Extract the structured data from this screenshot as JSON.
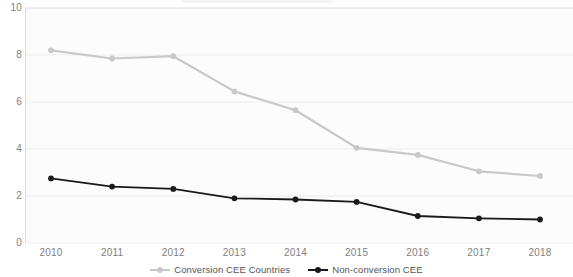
{
  "chart_data": {
    "type": "line",
    "title": "",
    "subtitle": "",
    "xlabel": "",
    "ylabel": "",
    "categories": [
      "2010",
      "2011",
      "2012",
      "2013",
      "2014",
      "2015",
      "2016",
      "2017",
      "2018"
    ],
    "x": [
      2010,
      2011,
      2012,
      2013,
      2014,
      2015,
      2016,
      2017,
      2018
    ],
    "ylim": [
      0,
      10
    ],
    "yticks": [
      "0",
      "2",
      "4",
      "6",
      "8",
      "10"
    ],
    "ytick_values": [
      0,
      2,
      4,
      6,
      8,
      10
    ],
    "grid": true,
    "grid_axis": "y",
    "legend_position": "bottom-center",
    "series": [
      {
        "name": "Conversion CEE Countries",
        "color": "#c9c9c9",
        "marker": "circle",
        "values": [
          8.2,
          7.85,
          7.95,
          6.45,
          5.65,
          4.05,
          3.75,
          3.05,
          2.85
        ]
      },
      {
        "name": "Non-conversion CEE",
        "color": "#1a1a1a",
        "marker": "circle",
        "values": [
          2.75,
          2.4,
          2.3,
          1.9,
          1.85,
          1.75,
          1.15,
          1.05,
          1.0
        ]
      }
    ]
  },
  "axes": {
    "y_tick_labels": [
      "10",
      "8",
      "6",
      "4",
      "2",
      "0"
    ],
    "x_tick_labels": [
      "2010",
      "2011",
      "2012",
      "2013",
      "2014",
      "2015",
      "2016",
      "2017",
      "2018"
    ]
  },
  "legend": {
    "entries": [
      {
        "label": "Conversion CEE Countries",
        "color": "#c9c9c9",
        "marker": "line-dot-icon"
      },
      {
        "label": "Non-conversion CEE",
        "color": "#1a1a1a",
        "marker": "line-dot-icon"
      }
    ]
  },
  "colors": {
    "series_conversion": "#c9c9c9",
    "series_nonconversion": "#1a1a1a",
    "gridline": "#ececec",
    "axis": "#dcdcdc",
    "tick_text": "#808080",
    "legend_text": "#555555",
    "plot_background": "#fcfcfc"
  }
}
